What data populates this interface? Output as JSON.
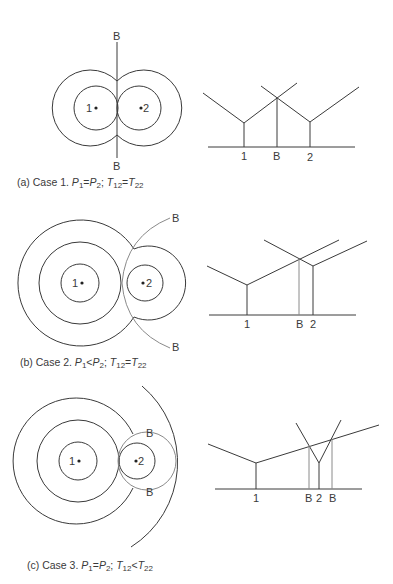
{
  "figure": {
    "panels": [
      {
        "id": "a",
        "caption": {
          "prefix": "(a)  Case 1. ",
          "p1": "P",
          "p1_sub": "1",
          "op1": "=",
          "p2": "P",
          "p2_sub": "2",
          "sep": "; ",
          "t1": "T",
          "t1_sub": "12",
          "op2": "=",
          "t2": "T",
          "t2_sub": "22"
        },
        "circle_labels": {
          "station1": "1",
          "station2": "2",
          "boundary_top": "B",
          "boundary_bottom": "B"
        },
        "profile_labels": {
          "station1": "1",
          "boundary": "B",
          "station2": "2"
        }
      },
      {
        "id": "b",
        "caption": {
          "prefix": "(b) Case 2. ",
          "p1": "P",
          "p1_sub": "1",
          "op1": "<",
          "p2": "P",
          "p2_sub": "2",
          "sep": "; ",
          "t1": "T",
          "t1_sub": "12",
          "op2": "=",
          "t2": "T",
          "t2_sub": "22"
        },
        "circle_labels": {
          "station1": "1",
          "station2": "2",
          "boundary_top": "B",
          "boundary_bottom": "B"
        },
        "profile_labels": {
          "station1": "1",
          "boundary": "B",
          "station2": "2"
        }
      },
      {
        "id": "c",
        "caption": {
          "prefix": "(c) Case 3. ",
          "p1": "P",
          "p1_sub": "1",
          "op1": "=",
          "p2": "P",
          "p2_sub": "2",
          "sep": "; ",
          "t1": "T",
          "t1_sub": "12",
          "op2": "<",
          "t2": "T",
          "t2_sub": "22"
        },
        "circle_labels": {
          "station1": "1",
          "station2": "2",
          "boundary_top": "B",
          "boundary_bottom": "B"
        },
        "profile_labels": {
          "station1": "1",
          "boundary_left": "B",
          "station2": "2",
          "boundary_right": "B"
        }
      }
    ],
    "colors": {
      "ink": "#3a3a3a",
      "boundary_gray": "#8a8a8a",
      "background": "#ffffff"
    }
  }
}
